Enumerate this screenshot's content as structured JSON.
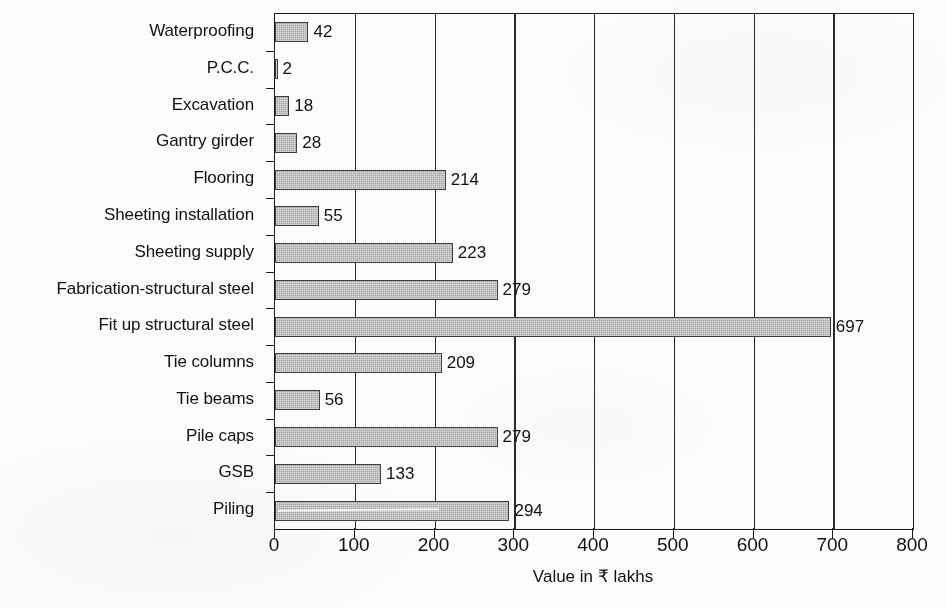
{
  "chart_data": {
    "type": "bar",
    "orientation": "horizontal",
    "title": "",
    "xlabel": "Value in ₹ lakhs",
    "ylabel": "",
    "xlim": [
      0,
      800
    ],
    "xticks": [
      0,
      100,
      200,
      300,
      400,
      500,
      600,
      700,
      800
    ],
    "xticklabels": [
      "0",
      "100",
      "200",
      "300",
      "400",
      "500",
      "600",
      "700",
      "800"
    ],
    "grid": "vertical-only",
    "legend": "none",
    "categories": [
      "Waterproofing",
      "P.C.C.",
      "Excavation",
      "Gantry girder",
      "Flooring",
      "Sheeting installation",
      "Sheeting supply",
      "Fabrication-structural steel",
      "Fit up structural steel",
      "Tie columns",
      "Tie beams",
      "Pile caps",
      "GSB",
      "Piling"
    ],
    "values": [
      42,
      2,
      18,
      28,
      214,
      55,
      223,
      279,
      697,
      209,
      56,
      279,
      133,
      294
    ],
    "data_labels": [
      "42",
      "2",
      "18",
      "28",
      "214",
      "55",
      "223",
      "279",
      "697",
      "209",
      "56",
      "279",
      "133",
      "294"
    ],
    "bar_fill_color": "#a8a8a8",
    "bar_edge_color": "#3d3d3d",
    "axis_color": "#1a1a1a",
    "background_color": "#fcfcfb"
  }
}
